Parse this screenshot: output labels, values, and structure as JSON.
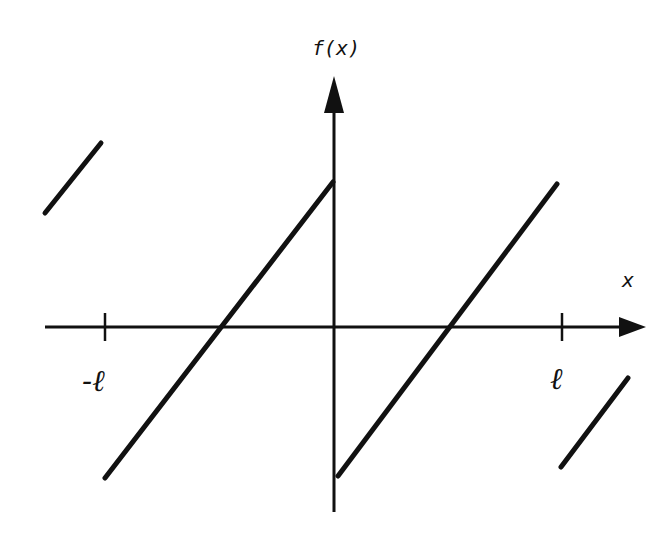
{
  "diagram": {
    "type": "sawtooth-function-graph",
    "labels": {
      "y_axis": "f(x)",
      "x_axis": "x",
      "neg_l": "-ℓ",
      "pos_l": "ℓ"
    },
    "colors": {
      "ink": "#111111",
      "background": "#ffffff"
    },
    "axes": {
      "x_axis": {
        "x1": 45,
        "y": 327,
        "x2": 620,
        "arrow_tip": 646
      },
      "y_axis": {
        "x": 334,
        "y1": 512,
        "y2": 110,
        "arrow_tip": 76
      },
      "ticks": [
        {
          "name": "tick-neg-l",
          "x": 105
        },
        {
          "name": "tick-pos-l",
          "x": 562
        }
      ]
    },
    "segments": [
      {
        "name": "segment-far-left",
        "x1": 45,
        "y1": 213,
        "x2": 101,
        "y2": 143
      },
      {
        "name": "segment-left-period",
        "x1": 105,
        "y1": 478,
        "x2": 333,
        "y2": 182
      },
      {
        "name": "segment-right-period",
        "x1": 338,
        "y1": 476,
        "x2": 557,
        "y2": 184
      },
      {
        "name": "segment-far-right",
        "x1": 561,
        "y1": 467,
        "x2": 628,
        "y2": 378
      }
    ]
  }
}
